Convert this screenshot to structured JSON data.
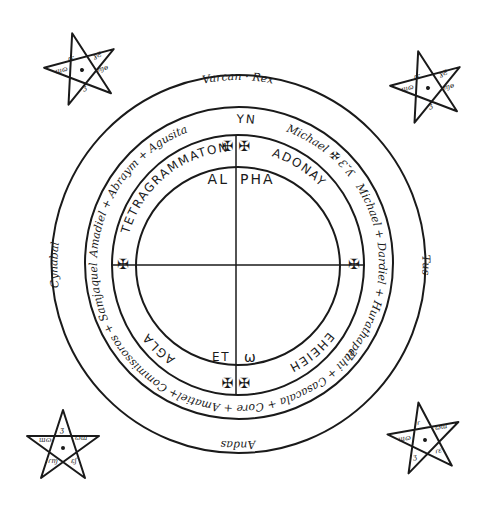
{
  "diagram": {
    "colors": {
      "ink": "#1a1a1a",
      "paper": "#ffffff"
    },
    "outer_ring": {
      "top": "Varcan · Rex",
      "right": "Tus",
      "bottom": "Andas",
      "left": "Cynabal"
    },
    "middle_ring": {
      "top": "YAYN",
      "top_right": "Michael ✠ Ɛ˘ʎ",
      "right": "Michael + Dardiel + Hurathapel",
      "bottom_right": "Tahi + Casacala + Core + Amatiel",
      "bottom_left": "+ Commissoros + Samjaquel",
      "left": "Amadiel + Abraym + Agusita"
    },
    "inner_ring": {
      "top_left": "TETRAGRAMMATON",
      "top_right": "ADONAY",
      "bottom_right": "EHEIEH",
      "bottom_left": "AGLA"
    },
    "center": {
      "top_left": "AL",
      "top_right": "PHA",
      "bottom_left": "ET",
      "bottom_right": "ω"
    },
    "crosses": {
      "top": "✠ ✠",
      "right": "✠",
      "bottom": "✠ ✠",
      "left": "✠"
    },
    "pentagrams": [
      {
        "position": "top-left",
        "center_mark": "•"
      },
      {
        "position": "top-right",
        "center_mark": "•"
      },
      {
        "position": "bottom-left",
        "center_mark": "•"
      },
      {
        "position": "bottom-right",
        "center_mark": "•"
      }
    ]
  }
}
